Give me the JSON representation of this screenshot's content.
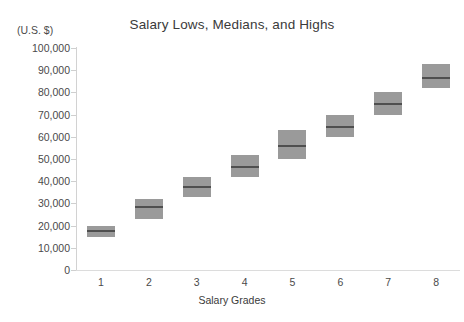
{
  "chart_data": {
    "type": "bar",
    "title": "Salary Lows, Medians, and Highs",
    "xlabel": "Salary Grades",
    "ylabel": "(U.S. $)",
    "categories": [
      "1",
      "2",
      "3",
      "4",
      "5",
      "6",
      "7",
      "8"
    ],
    "ylim": [
      0,
      100000
    ],
    "yticks": [
      0,
      10000,
      20000,
      30000,
      40000,
      50000,
      60000,
      70000,
      80000,
      90000,
      100000
    ],
    "ytick_labels": [
      "0",
      "10,000",
      "20,000",
      "30,000",
      "40,000",
      "50,000",
      "60,000",
      "70,000",
      "80,000",
      "90,000",
      "100,000"
    ],
    "grid": false,
    "legend": null,
    "series": [
      {
        "name": "Low",
        "values": [
          15000,
          23000,
          33000,
          42000,
          50000,
          60000,
          70000,
          82000
        ]
      },
      {
        "name": "Median",
        "values": [
          17500,
          28500,
          37500,
          46500,
          56000,
          64500,
          75000,
          86500
        ]
      },
      {
        "name": "High",
        "values": [
          20000,
          32000,
          42000,
          52000,
          63000,
          70000,
          80000,
          93000
        ]
      }
    ],
    "box_color": "#9a9a9a",
    "median_color": "#4f4f4f",
    "axis_color": "#d2d2d2",
    "text_color": "#4a4a4a"
  }
}
